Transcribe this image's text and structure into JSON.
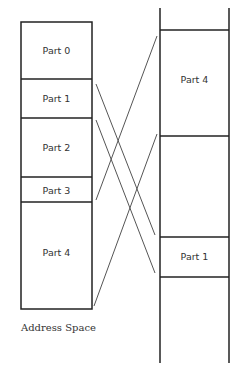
{
  "diagram": {
    "type": "memory-mapping",
    "colors": {
      "stroke": "#222222",
      "line": "#555555",
      "text": "#333333",
      "background": "#ffffff"
    },
    "address_space": {
      "caption": "Address Space",
      "parts": [
        {
          "id": "part0",
          "label": "Part 0"
        },
        {
          "id": "part1",
          "label": "Part 1"
        },
        {
          "id": "part2",
          "label": "Part 2"
        },
        {
          "id": "part3",
          "label": "Part 3"
        },
        {
          "id": "part4",
          "label": "Part 4"
        }
      ]
    },
    "physical_memory": {
      "blocks": [
        {
          "id": "phys-part4",
          "label": "Part 4"
        },
        {
          "id": "phys-part1",
          "label": "Part 1"
        }
      ]
    },
    "mappings": [
      {
        "from": "Part 1",
        "to": "Part 1"
      },
      {
        "from": "Part 4",
        "to": "Part 4"
      }
    ]
  }
}
